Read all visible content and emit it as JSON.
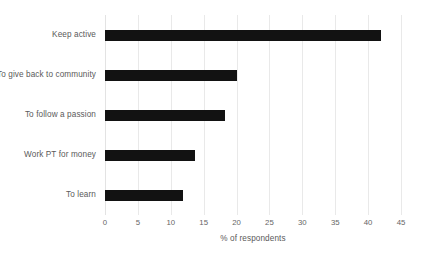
{
  "chart_data": {
    "type": "bar",
    "orientation": "horizontal",
    "title": "",
    "subtitle": "",
    "xlabel": "% of respondents",
    "ylabel": "",
    "categories": [
      "Keep active",
      "To give back to community",
      "To follow a passion",
      "Work PT for money",
      "To learn"
    ],
    "values": [
      42,
      20,
      18.2,
      13.7,
      11.9
    ],
    "xlim": [
      0,
      45
    ],
    "xticks": [
      0,
      5,
      10,
      15,
      20,
      25,
      30,
      35,
      40,
      45
    ],
    "xtick_labels": [
      "0",
      "5",
      "10",
      "15",
      "20",
      "25",
      "30",
      "35",
      "40",
      "45"
    ],
    "grid": "vertical",
    "legend": "none",
    "bar_color": "#121212",
    "gridline_color": "#e9e9e9",
    "text_color": "#5a5a5a",
    "background_color": "#ffffff"
  }
}
